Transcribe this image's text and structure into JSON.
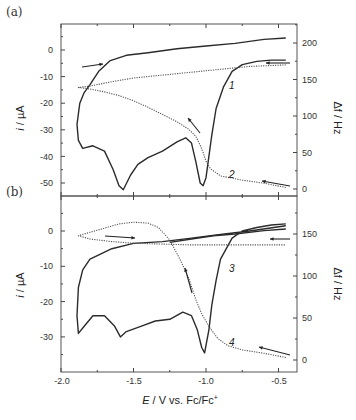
{
  "chart_data": [
    {
      "panel": "(a)",
      "type": "line",
      "xlabel": "E / V vs. Fc/Fc+",
      "ylabel_left": "i / µA",
      "ylabel_right": "Δf / Hz",
      "xlim": [
        -2.0,
        -0.37
      ],
      "ylim_left": [
        -55,
        10
      ],
      "ylim_right": [
        -10,
        225
      ],
      "left_ticks": [
        0,
        -10,
        -20,
        -30,
        -40,
        -50
      ],
      "right_ticks": [
        200,
        150,
        100,
        50,
        0
      ],
      "series": [
        {
          "name": "1",
          "axis": "left",
          "style": "solid",
          "points": [
            [
              -0.45,
              -3.8
            ],
            [
              -0.55,
              -3.8
            ],
            [
              -0.65,
              -4.3
            ],
            [
              -0.75,
              -5.5
            ],
            [
              -0.82,
              -8
            ],
            [
              -0.88,
              -14
            ],
            [
              -0.93,
              -22
            ],
            [
              -0.96,
              -32
            ],
            [
              -0.98,
              -40
            ],
            [
              -1.0,
              -48
            ],
            [
              -1.02,
              -51
            ],
            [
              -1.04,
              -50
            ],
            [
              -1.07,
              -42
            ],
            [
              -1.1,
              -35
            ],
            [
              -1.14,
              -33
            ],
            [
              -1.2,
              -34.5
            ],
            [
              -1.3,
              -38
            ],
            [
              -1.4,
              -40.5
            ],
            [
              -1.47,
              -43
            ],
            [
              -1.52,
              -47
            ],
            [
              -1.57,
              -52.5
            ],
            [
              -1.6,
              -51
            ],
            [
              -1.64,
              -45
            ],
            [
              -1.7,
              -38
            ],
            [
              -1.78,
              -36
            ],
            [
              -1.85,
              -37
            ],
            [
              -1.88,
              -34
            ],
            [
              -1.89,
              -28
            ],
            [
              -1.87,
              -20
            ],
            [
              -1.84,
              -16
            ],
            [
              -1.8,
              -13
            ],
            [
              -1.74,
              -8
            ],
            [
              -1.66,
              -4
            ],
            [
              -1.55,
              -2
            ],
            [
              -1.4,
              -1
            ],
            [
              -1.2,
              0.5
            ],
            [
              -1.0,
              1.5
            ],
            [
              -0.8,
              2.5
            ],
            [
              -0.6,
              4
            ],
            [
              -0.45,
              4.5
            ]
          ]
        },
        {
          "name": "2",
          "axis": "right",
          "style": "dotted",
          "points": [
            [
              -0.45,
              2
            ],
            [
              -0.6,
              8
            ],
            [
              -0.75,
              12
            ],
            [
              -0.9,
              18
            ],
            [
              -0.97,
              28
            ],
            [
              -1.0,
              38
            ],
            [
              -1.02,
              50
            ],
            [
              -1.04,
              60
            ],
            [
              -1.07,
              72
            ],
            [
              -1.12,
              82
            ],
            [
              -1.2,
              92
            ],
            [
              -1.3,
              102
            ],
            [
              -1.4,
              112
            ],
            [
              -1.5,
              121
            ],
            [
              -1.6,
              128
            ],
            [
              -1.7,
              133
            ],
            [
              -1.8,
              137
            ],
            [
              -1.88,
              139
            ],
            [
              -1.8,
              141
            ],
            [
              -1.65,
              147
            ],
            [
              -1.5,
              152
            ],
            [
              -1.3,
              156
            ],
            [
              -1.1,
              160
            ],
            [
              -0.9,
              164
            ],
            [
              -0.7,
              168
            ],
            [
              -0.45,
              170
            ]
          ]
        }
      ],
      "annotations": [
        "1",
        "2",
        "arrow-right (upper left)",
        "arrow-left (upper right)",
        "arrow-up-left (mid)",
        "arrow-left (lower right)"
      ]
    },
    {
      "panel": "(b)",
      "type": "line",
      "xlabel": "E / V vs. Fc/Fc+",
      "ylabel_left": "i / µA",
      "ylabel_right": "Δf / Hz",
      "xlim": [
        -2.0,
        -0.37
      ],
      "ylim_left": [
        -40,
        10
      ],
      "ylim_right": [
        -15,
        195
      ],
      "left_ticks": [
        0,
        -10,
        -20,
        -30
      ],
      "right_ticks": [
        150,
        100,
        50,
        0
      ],
      "x_ticks": [
        -2.0,
        -1.5,
        -1.0,
        -0.5
      ],
      "series": [
        {
          "name": "3",
          "axis": "left",
          "style": "solid",
          "points": [
            [
              -0.45,
              2
            ],
            [
              -0.55,
              1.7
            ],
            [
              -0.65,
              1
            ],
            [
              -0.75,
              0
            ],
            [
              -0.82,
              -2
            ],
            [
              -0.86,
              -5
            ],
            [
              -0.9,
              -8
            ],
            [
              -0.93,
              -14
            ],
            [
              -0.96,
              -21
            ],
            [
              -0.98,
              -28
            ],
            [
              -1.01,
              -34.5
            ],
            [
              -1.03,
              -33
            ],
            [
              -1.06,
              -28
            ],
            [
              -1.1,
              -24
            ],
            [
              -1.16,
              -23
            ],
            [
              -1.25,
              -25
            ],
            [
              -1.35,
              -25.5
            ],
            [
              -1.45,
              -27
            ],
            [
              -1.55,
              -28.5
            ],
            [
              -1.59,
              -30
            ],
            [
              -1.63,
              -27
            ],
            [
              -1.7,
              -24
            ],
            [
              -1.78,
              -24
            ],
            [
              -1.84,
              -27
            ],
            [
              -1.88,
              -29
            ],
            [
              -1.89,
              -24
            ],
            [
              -1.88,
              -16
            ],
            [
              -1.85,
              -11
            ],
            [
              -1.8,
              -8
            ],
            [
              -1.75,
              -7
            ],
            [
              -1.65,
              -5
            ],
            [
              -1.5,
              -3.5
            ],
            [
              -1.3,
              -3
            ],
            [
              -1.1,
              -2
            ],
            [
              -0.9,
              -1
            ],
            [
              -0.7,
              0
            ],
            [
              -0.45,
              1.5
            ]
          ]
        },
        {
          "name": "4",
          "axis": "right",
          "style": "dotted",
          "points": [
            [
              -0.45,
              3
            ],
            [
              -0.6,
              8
            ],
            [
              -0.75,
              12
            ],
            [
              -0.85,
              17
            ],
            [
              -0.92,
              26
            ],
            [
              -0.98,
              40
            ],
            [
              -1.03,
              55
            ],
            [
              -1.07,
              72
            ],
            [
              -1.12,
              98
            ],
            [
              -1.18,
              120
            ],
            [
              -1.25,
              143
            ],
            [
              -1.33,
              158
            ],
            [
              -1.4,
              163
            ],
            [
              -1.5,
              164
            ],
            [
              -1.6,
              162
            ],
            [
              -1.7,
              157
            ],
            [
              -1.8,
              152
            ],
            [
              -1.88,
              148
            ],
            [
              -1.8,
              144
            ],
            [
              -1.65,
              141
            ],
            [
              -1.5,
              139
            ],
            [
              -1.3,
              138
            ],
            [
              -1.1,
              137
            ],
            [
              -0.9,
              137
            ],
            [
              -0.7,
              137
            ],
            [
              -0.45,
              137
            ]
          ]
        },
        {
          "name": "3-freq",
          "axis": "right",
          "style": "solid",
          "points": [
            [
              -1.25,
              140
            ],
            [
              -1.1,
              144
            ],
            [
              -0.95,
              148
            ],
            [
              -0.8,
              150
            ],
            [
              -0.6,
              154
            ],
            [
              -0.45,
              156
            ]
          ]
        }
      ],
      "annotations": [
        "3",
        "4",
        "arrow-right (upper left)",
        "arrow-left (upper right)",
        "arrow-up (mid)",
        "arrow-left (lower right)"
      ]
    }
  ],
  "labels": {
    "panel_a": "(a)",
    "panel_b": "(b)",
    "ylabel_left": "i / µA",
    "ylabel_left_italic": "i",
    "ylabel_left_rest": " / µA",
    "ylabel_right": "Δf / Hz",
    "xlabel_italic": "E",
    "xlabel_rest": " / V vs. Fc/Fc",
    "xlabel_sup": "+",
    "curve1": "1",
    "curve2": "2",
    "curve3": "3",
    "curve4": "4",
    "a_left_ticks": [
      "0",
      "-10",
      "-20",
      "-30",
      "-40",
      "-50"
    ],
    "a_right_ticks": [
      "200",
      "150",
      "100",
      "50",
      "0"
    ],
    "b_left_ticks": [
      "0",
      "-10",
      "-20",
      "-30"
    ],
    "b_right_ticks": [
      "150",
      "100",
      "50",
      "0"
    ],
    "x_ticks": [
      "-2.0",
      "-1.5",
      "-1.0",
      "-0.5"
    ]
  },
  "colors": {
    "line": "#2b2b2b",
    "dotted": "#555555",
    "axis": "#444444"
  }
}
